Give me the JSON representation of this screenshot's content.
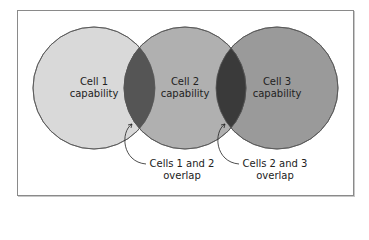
{
  "diagram": {
    "circles": [
      {
        "label_line1": "Cell 1",
        "label_line2": "capability",
        "fill": "#d9d9d9"
      },
      {
        "label_line1": "Cell 2",
        "label_line2": "capability",
        "fill": "#b0b0b0"
      },
      {
        "label_line1": "Cell 3",
        "label_line2": "capability",
        "fill": "#9a9a9a"
      }
    ],
    "overlap_fill": "#555555",
    "callouts": [
      {
        "line1": "Cells 1 and 2",
        "line2": "overlap"
      },
      {
        "line1": "Cells 2 and 3",
        "line2": "overlap"
      }
    ]
  }
}
